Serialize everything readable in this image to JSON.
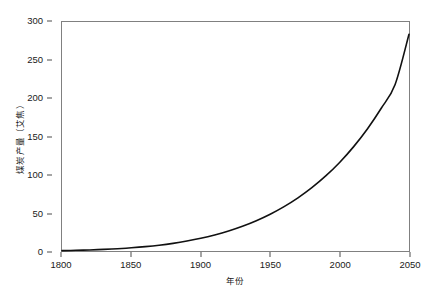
{
  "chart_data": {
    "type": "line",
    "title": "",
    "xlabel": "年份",
    "ylabel": "煤炭产量（艾焦）",
    "xlim": [
      1800,
      2050
    ],
    "ylim": [
      0,
      300
    ],
    "grid": false,
    "legend": false,
    "line_color": "#111111",
    "xticks": [
      1800,
      1850,
      1900,
      1950,
      2000,
      2050
    ],
    "xtick_labels": [
      "1800",
      "1850",
      "1900",
      "1950",
      "2000",
      "2050"
    ],
    "yticks": [
      0,
      50,
      100,
      150,
      200,
      250,
      300
    ],
    "ytick_labels": [
      "0",
      "50",
      "100",
      "150",
      "200",
      "250",
      "300"
    ],
    "series": [
      {
        "name": "煤炭产量",
        "x": [
          1800,
          1810,
          1820,
          1830,
          1840,
          1850,
          1860,
          1870,
          1880,
          1890,
          1900,
          1910,
          1920,
          1930,
          1940,
          1950,
          1960,
          1970,
          1980,
          1990,
          2000,
          2010,
          2020,
          2030,
          2040,
          2050
        ],
        "values": [
          0.5,
          0.9,
          1.4,
          2.1,
          3.0,
          4.2,
          5.7,
          7.6,
          10.0,
          13.0,
          16.6,
          21.0,
          26.2,
          32.4,
          39.7,
          48.2,
          58.1,
          69.6,
          82.9,
          98.3,
          116.0,
          136.4,
          159.9,
          187.0,
          218.2,
          284.0
        ]
      }
    ]
  },
  "axes": {
    "spine_color": "#808080",
    "tick_color": "#4d4d4d"
  }
}
